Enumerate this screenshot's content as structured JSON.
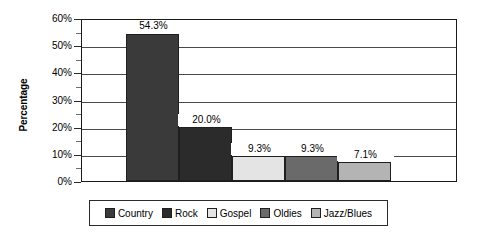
{
  "chart_data": {
    "type": "bar",
    "title": "",
    "subtitle": "",
    "xlabel": "",
    "ylabel": "Percentage",
    "categories": [
      "Country",
      "Rock",
      "Gospel",
      "Oldies",
      "Jazz/Blues"
    ],
    "values": [
      54.3,
      20.0,
      9.3,
      9.3,
      7.1
    ],
    "data_labels": [
      "54.3%",
      "20.0%",
      "9.3%",
      "9.3%",
      "7.1%"
    ],
    "ylim": [
      0,
      60
    ],
    "y_tick_step": 10,
    "y_minor_step": 5,
    "y_tick_labels": [
      "0%",
      "10%",
      "20%",
      "30%",
      "40%",
      "50%",
      "60%"
    ],
    "y_tick_values": [
      0,
      10,
      20,
      30,
      40,
      50,
      60
    ],
    "y_minor_values": [
      5,
      15,
      25,
      35,
      45,
      55
    ],
    "grid": true,
    "grid_axis": "y",
    "legend_position": "bottom",
    "bar_gap": 0,
    "series": [
      {
        "name": "Music preference",
        "values": [
          54.3,
          20.0,
          9.3,
          9.3,
          7.1
        ]
      }
    ],
    "colors": [
      "#3a3a3a",
      "#2b2b2b",
      "#e4e4e4",
      "#6a6a6a",
      "#b4b4b4"
    ],
    "axis_color": "#1a1a1a",
    "grid_color": "#4a4a4a",
    "background": "#ffffff"
  },
  "legend": {
    "entries": [
      {
        "label": "Country",
        "color": "#3a3a3a"
      },
      {
        "label": "Rock",
        "color": "#2b2b2b"
      },
      {
        "label": "Gospel",
        "color": "#e4e4e4"
      },
      {
        "label": "Oldies",
        "color": "#6a6a6a"
      },
      {
        "label": "Jazz/Blues",
        "color": "#b4b4b4"
      }
    ]
  },
  "axis": {
    "y_title": "Percentage",
    "ticks": [
      {
        "label": "60%",
        "value": 60
      },
      {
        "label": "50%",
        "value": 50
      },
      {
        "label": "40%",
        "value": 40
      },
      {
        "label": "30%",
        "value": 30
      },
      {
        "label": "20%",
        "value": 20
      },
      {
        "label": "10%",
        "value": 10
      },
      {
        "label": "0%",
        "value": 0
      }
    ]
  }
}
